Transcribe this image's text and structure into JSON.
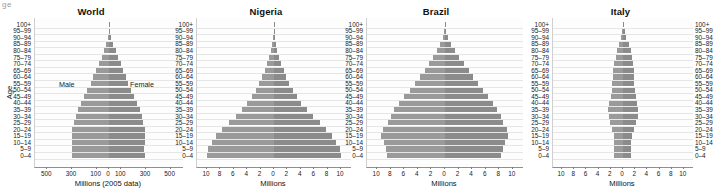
{
  "figure": {
    "corner_fragment": "ge",
    "y_axis_title": "Age",
    "age_groups": [
      "100+",
      "95–99",
      "90–94",
      "85–89",
      "80–84",
      "75–79",
      "70–74",
      "65–69",
      "60–64",
      "55–59",
      "50–54",
      "45–49",
      "40–44",
      "35–39",
      "30–34",
      "25–29",
      "20–24",
      "15–19",
      "10–14",
      "5–9",
      "0–4"
    ],
    "colors": {
      "male_bar": "#9a9a9a",
      "female_bar": "#8b8b8b",
      "gridline": "#e6e6e6",
      "axis": "#8f8f8f",
      "text": "#1a1a1a"
    }
  },
  "chart_data": [
    {
      "type": "bar",
      "title": "World",
      "xlabel": "Millions (2005 data)",
      "ylabel": "Age",
      "xlim": [
        -600,
        600
      ],
      "xticks": [
        -500,
        -300,
        -100,
        0,
        100,
        300,
        500
      ],
      "xticklabels": [
        "500",
        "300",
        "100",
        "0",
        "100",
        "300",
        "500"
      ],
      "grid": true,
      "legend": [
        "Male",
        "Female"
      ],
      "annotations": [
        {
          "text": "Male"
        },
        {
          "text": "Female"
        }
      ],
      "categories": [
        "100+",
        "95–99",
        "90–94",
        "85–89",
        "80–84",
        "75–79",
        "70–74",
        "65–69",
        "60–64",
        "55–59",
        "50–54",
        "45–49",
        "40–44",
        "35–39",
        "30–34",
        "25–29",
        "20–24",
        "15–19",
        "10–14",
        "5–9",
        "0–4"
      ],
      "series": [
        {
          "name": "Male",
          "values": [
            1,
            4,
            10,
            22,
            40,
            60,
            82,
            105,
            128,
            150,
            176,
            200,
            228,
            250,
            268,
            282,
            296,
            302,
            300,
            298,
            300
          ]
        },
        {
          "name": "Female",
          "values": [
            3,
            9,
            20,
            36,
            56,
            76,
            96,
            116,
            136,
            156,
            180,
            202,
            228,
            248,
            264,
            276,
            288,
            292,
            288,
            286,
            288
          ]
        }
      ]
    },
    {
      "type": "bar",
      "title": "Nigeria",
      "xlabel": "Millions",
      "ylabel": "",
      "xlim": [
        -11.5,
        11.5
      ],
      "xticks": [
        -10,
        -8,
        -6,
        -4,
        -2,
        0,
        2,
        4,
        6,
        8,
        10
      ],
      "xticklabels": [
        "10",
        "8",
        "6",
        "4",
        "2",
        "0",
        "2",
        "4",
        "6",
        "8",
        "10"
      ],
      "grid": true,
      "categories": [
        "100+",
        "95–99",
        "90–94",
        "85–89",
        "80–84",
        "75–79",
        "70–74",
        "65–69",
        "60–64",
        "55–59",
        "50–54",
        "45–49",
        "40–44",
        "35–39",
        "30–34",
        "25–29",
        "20–24",
        "15–19",
        "10–14",
        "5–9",
        "0–4"
      ],
      "series": [
        {
          "name": "Male",
          "values": [
            0.02,
            0.05,
            0.12,
            0.25,
            0.45,
            0.7,
            1.0,
            1.35,
            1.75,
            2.2,
            2.7,
            3.3,
            4.0,
            4.8,
            5.7,
            6.7,
            7.7,
            8.6,
            9.3,
            9.8,
            10.0
          ]
        },
        {
          "name": "Female",
          "values": [
            0.03,
            0.07,
            0.15,
            0.3,
            0.5,
            0.78,
            1.1,
            1.45,
            1.85,
            2.3,
            2.8,
            3.4,
            4.1,
            4.9,
            5.8,
            6.8,
            7.8,
            8.7,
            9.3,
            9.8,
            10.0
          ]
        }
      ]
    },
    {
      "type": "bar",
      "title": "Brazil",
      "xlabel": "Millions",
      "ylabel": "",
      "xlim": [
        -11.5,
        11.5
      ],
      "xticks": [
        -10,
        -8,
        -6,
        -4,
        -2,
        0,
        2,
        4,
        6,
        8,
        10
      ],
      "xticklabels": [
        "10",
        "8",
        "6",
        "4",
        "2",
        "0",
        "2",
        "4",
        "6",
        "8",
        "10"
      ],
      "grid": true,
      "categories": [
        "100+",
        "95–99",
        "90–94",
        "85–89",
        "80–84",
        "75–79",
        "70–74",
        "65–69",
        "60–64",
        "55–59",
        "50–54",
        "45–49",
        "40–44",
        "35–39",
        "30–34",
        "25–29",
        "20–24",
        "15–19",
        "10–14",
        "5–9",
        "0–4"
      ],
      "series": [
        {
          "name": "Male",
          "values": [
            0.05,
            0.15,
            0.35,
            0.7,
            1.15,
            1.7,
            2.3,
            3.0,
            3.7,
            4.4,
            5.2,
            6.0,
            6.8,
            7.5,
            8.0,
            8.4,
            9.2,
            9.4,
            9.0,
            8.7,
            8.5
          ]
        },
        {
          "name": "Female",
          "values": [
            0.08,
            0.22,
            0.5,
            0.95,
            1.5,
            2.1,
            2.8,
            3.5,
            4.2,
            4.9,
            5.6,
            6.4,
            7.1,
            7.7,
            8.2,
            8.6,
            9.2,
            9.3,
            8.8,
            8.5,
            8.3
          ]
        }
      ]
    },
    {
      "type": "bar",
      "title": "Italy",
      "xlabel": "Millions",
      "ylabel": "",
      "xlim": [
        -11.5,
        11.5
      ],
      "xticks": [
        -10,
        -8,
        -6,
        -4,
        -2,
        0,
        2,
        4,
        6,
        8,
        10
      ],
      "xticklabels": [
        "10",
        "8",
        "6",
        "4",
        "2",
        "0",
        "2",
        "4",
        "6",
        "8",
        "10"
      ],
      "grid": true,
      "categories": [
        "100+",
        "95–99",
        "90–94",
        "85–89",
        "80–84",
        "75–79",
        "70–74",
        "65–69",
        "60–64",
        "55–59",
        "50–54",
        "45–49",
        "40–44",
        "35–39",
        "30–34",
        "25–29",
        "20–24",
        "15–19",
        "10–14",
        "5–9",
        "0–4"
      ],
      "series": [
        {
          "name": "Male",
          "values": [
            0.02,
            0.1,
            0.3,
            0.6,
            0.95,
            1.2,
            1.45,
            1.6,
            1.7,
            1.75,
            1.85,
            2.0,
            2.3,
            2.45,
            2.35,
            2.1,
            1.8,
            1.5,
            1.4,
            1.4,
            1.4
          ]
        },
        {
          "name": "Female",
          "values": [
            0.06,
            0.25,
            0.55,
            0.95,
            1.3,
            1.5,
            1.7,
            1.75,
            1.8,
            1.85,
            1.95,
            2.1,
            2.35,
            2.5,
            2.4,
            2.1,
            1.8,
            1.45,
            1.35,
            1.35,
            1.35
          ]
        }
      ]
    }
  ]
}
